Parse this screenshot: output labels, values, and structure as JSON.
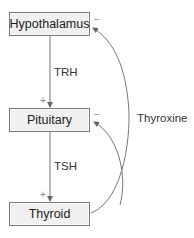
{
  "diagram": {
    "nodes": [
      {
        "id": "hypothalamus",
        "label": "Hypothalamus"
      },
      {
        "id": "pituitary",
        "label": "Pituitary"
      },
      {
        "id": "thyroid",
        "label": "Thyroid"
      }
    ],
    "edges": [
      {
        "from": "hypothalamus",
        "to": "pituitary",
        "label": "TRH",
        "sign": "+"
      },
      {
        "from": "pituitary",
        "to": "thyroid",
        "label": "TSH",
        "sign": "+"
      },
      {
        "from": "thyroid",
        "to": "hypothalamus",
        "label": "Thyroxine",
        "sign": "−"
      },
      {
        "from": "thyroid",
        "to": "pituitary",
        "label": "",
        "sign": "−"
      }
    ],
    "labels": {
      "trh": "TRH",
      "tsh": "TSH",
      "thyroxine": "Thyroxine",
      "plus": "+",
      "minus": "−"
    },
    "colors": {
      "box_fill": "#f0f0f0",
      "box_border": "#7a7a7a",
      "line": "#777777"
    }
  }
}
